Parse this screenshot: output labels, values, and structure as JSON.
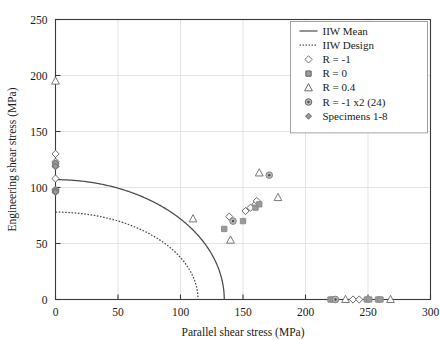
{
  "chart_data": {
    "type": "scatter",
    "title": "",
    "xlabel": "Parallel shear stress (MPa)",
    "ylabel": "Engineering shear stress (MPa)",
    "xlim": [
      0,
      300
    ],
    "ylim": [
      0,
      250
    ],
    "xticks": [
      0,
      50,
      100,
      150,
      200,
      250,
      300
    ],
    "yticks": [
      0,
      50,
      100,
      150,
      200,
      250
    ],
    "xtick_labels": [
      "0",
      "50",
      "100",
      "150",
      "200",
      "250",
      "300"
    ],
    "ytick_labels": [
      "0",
      "50",
      "100",
      "150",
      "200",
      "250"
    ],
    "grid": true,
    "legend_position": "top-right",
    "curves": [
      {
        "name": "IIW Mean",
        "style": "solid",
        "color": "#4a4a4a",
        "shape": "elliptical-interaction",
        "y_intercept": 107,
        "x_intercept": 135,
        "exponent": 2
      },
      {
        "name": "IIW Design",
        "style": "dotted",
        "color": "#4a4a4a",
        "shape": "elliptical-interaction",
        "y_intercept": 78,
        "x_intercept": 114,
        "exponent": 2
      }
    ],
    "series": [
      {
        "name": "R = -1",
        "marker": "open-diamond",
        "color": "#5a5a5a",
        "fill": "none",
        "points": [
          [
            0,
            130
          ],
          [
            0,
            123
          ],
          [
            0,
            119
          ],
          [
            0,
            108
          ],
          [
            0,
            98
          ],
          [
            0,
            96
          ],
          [
            139,
            74
          ],
          [
            152,
            79
          ],
          [
            156,
            82
          ],
          [
            160,
            85
          ],
          [
            161,
            88
          ],
          [
            238,
            0
          ],
          [
            243,
            0
          ]
        ]
      },
      {
        "name": "R = 0",
        "marker": "filled-square",
        "color": "#8a8a8a",
        "fill": "#9a9a9a",
        "points": [
          [
            0,
            120
          ],
          [
            0,
            97
          ],
          [
            135,
            63
          ],
          [
            150,
            70
          ],
          [
            160,
            82
          ],
          [
            163,
            85
          ],
          [
            220,
            0
          ],
          [
            222,
            0
          ],
          [
            249,
            0
          ],
          [
            251,
            0
          ],
          [
            258,
            0
          ],
          [
            260,
            0
          ]
        ]
      },
      {
        "name": "R = 0.4",
        "marker": "open-triangle",
        "color": "#6a6a6a",
        "fill": "none",
        "points": [
          [
            0,
            195
          ],
          [
            110,
            72
          ],
          [
            140,
            53
          ],
          [
            163,
            113
          ],
          [
            178,
            91
          ],
          [
            232,
            0
          ],
          [
            268,
            0
          ]
        ]
      },
      {
        "name": "R = -1 x2 (24)",
        "marker": "circle-dot",
        "color": "#7a7a7a",
        "fill": "#b8b8b8",
        "points": [
          [
            0,
            121
          ],
          [
            0,
            97
          ],
          [
            142,
            70
          ],
          [
            171,
            111
          ],
          [
            224,
            0
          ]
        ]
      },
      {
        "name": "Specimens 1-8",
        "marker": "small-diamond",
        "color": "#6a6a6a",
        "fill": "#9a9a9a",
        "points": [
          [
            0,
            122
          ],
          [
            0,
            119
          ],
          [
            0,
            97
          ],
          [
            0,
            96
          ]
        ]
      }
    ]
  },
  "legend": {
    "items": [
      {
        "label": "IIW Mean",
        "marker": "line-solid"
      },
      {
        "label": "IIW Design",
        "marker": "line-dotted"
      },
      {
        "label": "R = -1",
        "marker": "open-diamond"
      },
      {
        "label": "R = 0",
        "marker": "filled-square"
      },
      {
        "label": "R = 0.4",
        "marker": "open-triangle"
      },
      {
        "label": "R = -1 x2 (24)",
        "marker": "circle-dot"
      },
      {
        "label": "Specimens 1-8",
        "marker": "small-diamond"
      }
    ]
  },
  "colors": {
    "axis": "#3a3a3a",
    "grid": "#d8d8d8",
    "curve": "#4a4a4a",
    "marker_gray": "#9a9a9a",
    "background": "#ffffff"
  }
}
